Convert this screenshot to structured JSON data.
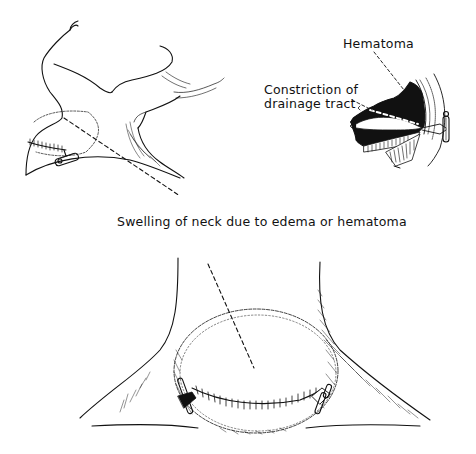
{
  "figure": {
    "labels": {
      "hematoma": "Hematoma",
      "constriction_line1": "Constriction of",
      "constriction_line2": "drainage tract",
      "swelling": "Swelling of neck due to edema or hematoma"
    },
    "panels": [
      {
        "id": "side-view",
        "description": "Lateral view of head and neck with sutured incision and drain"
      },
      {
        "id": "cross-section-inset",
        "description": "Cross-section showing hematoma and constricted drainage tract"
      },
      {
        "id": "front-view",
        "description": "Anterior view of neck with swollen area, sutured incision and two drains"
      }
    ],
    "colors": {
      "ink": "#111111",
      "background": "#ffffff"
    }
  }
}
